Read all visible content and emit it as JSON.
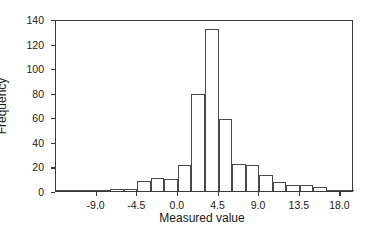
{
  "chart_data": {
    "type": "bar",
    "title": "",
    "subtitle": "",
    "xlabel": "Measured value",
    "ylabel": "Frequency",
    "xlim": [
      -13.5,
      19.5
    ],
    "ylim": [
      0,
      140
    ],
    "grid": false,
    "legend": null,
    "bin_width": 1.5,
    "x_ticks": [
      "-9.0",
      "-4.5",
      "0.0",
      "4.5",
      "9.0",
      "13.5",
      "18.0"
    ],
    "x_tick_values": [
      -9.0,
      -4.5,
      0.0,
      4.5,
      9.0,
      13.5,
      18.0
    ],
    "y_ticks": [
      "0",
      "20",
      "40",
      "60",
      "80",
      "100",
      "120",
      "140"
    ],
    "y_tick_values": [
      0,
      20,
      40,
      60,
      80,
      100,
      120,
      140
    ],
    "bin_starts": [
      -13.5,
      -12.0,
      -10.5,
      -9.0,
      -7.5,
      -6.0,
      -4.5,
      -3.0,
      -1.5,
      0.0,
      1.5,
      3.0,
      4.5,
      6.0,
      7.5,
      9.0,
      10.5,
      12.0,
      13.5,
      15.0,
      16.5,
      18.0
    ],
    "categories": [
      "-13.5",
      "-12.0",
      "-10.5",
      "-9.0",
      "-7.5",
      "-6.0",
      "-4.5",
      "-3.0",
      "-1.5",
      "0.0",
      "1.5",
      "3.0",
      "4.5",
      "6.0",
      "7.5",
      "9.0",
      "10.5",
      "12.0",
      "13.5",
      "15.0",
      "16.5",
      "18.0"
    ],
    "values": [
      1,
      1,
      1,
      1,
      2,
      2,
      8,
      11,
      10,
      21,
      79,
      132,
      59,
      22,
      21,
      13,
      7,
      5,
      5,
      3,
      1,
      1
    ],
    "colors": {
      "bar_fill": "#ffffff",
      "bar_edge": "#4a4a4a",
      "axis": "#3a3a3a",
      "text": "#1a1a1a",
      "background": "#ffffff"
    }
  }
}
